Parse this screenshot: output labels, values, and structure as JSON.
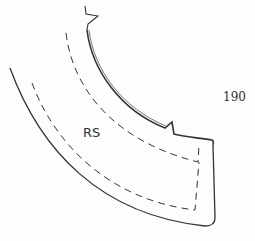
{
  "figure": {
    "number": "190",
    "piece_label": "RS",
    "colors": {
      "line": "#333333",
      "background": "#fdfdfd"
    }
  }
}
